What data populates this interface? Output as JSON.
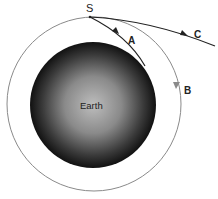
{
  "diagram": {
    "type": "orbital-trajectories",
    "body": {
      "label": "Earth",
      "center": [
        93,
        105
      ],
      "radius": 63
    },
    "orbit": {
      "center": [
        94,
        104
      ],
      "radius": 87,
      "color": "#8a8a8a"
    },
    "start_point": {
      "label": "S",
      "position": [
        90,
        17
      ]
    },
    "paths": [
      {
        "label": "A",
        "description": "curves down and hits Earth",
        "color": "#222222"
      },
      {
        "label": "B",
        "description": "circular orbit around Earth",
        "color": "#8a8a8a"
      },
      {
        "label": "C",
        "description": "escapes along shallow curve",
        "color": "#222222"
      }
    ]
  }
}
